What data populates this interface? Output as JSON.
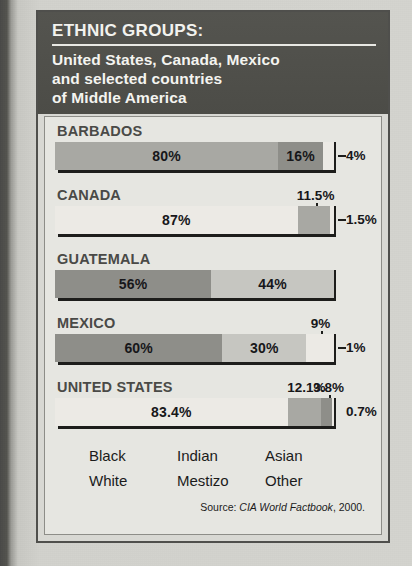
{
  "header": {
    "title": "ETHNIC GROUPS:",
    "subtitle_lines": [
      "United States, Canada, Mexico",
      "and selected countries",
      "of Middle America"
    ]
  },
  "legend": {
    "items": [
      "Black",
      "Indian",
      "Asian",
      "White",
      "Mestizo",
      "Other"
    ]
  },
  "source": {
    "prefix": "Source:",
    "publication": "CIA World Factbook",
    "year": ", 2000."
  },
  "colors": {
    "paper": "#d4d4cf",
    "header_bg": "#4c4c47",
    "panel_bg": "#e6e6e1",
    "frame": "#4f4f4c",
    "seg_dark": "#8e8e89",
    "seg_mid": "#a8a8a3",
    "seg_light": "#c6c6c1",
    "seg_white": "#eceae5",
    "ink": "#1d1d1b"
  },
  "chart_data": {
    "type": "bar",
    "title": "ETHNIC GROUPS: United States, Canada, Mexico and selected countries of Middle America",
    "orientation": "horizontal-stacked",
    "unit": "percent",
    "xlim": [
      0,
      100
    ],
    "grid": false,
    "legend_position": "bottom",
    "legend_entries": [
      "Black",
      "Indian",
      "Asian",
      "White",
      "Mestizo",
      "Other"
    ],
    "categories": [
      "BARBADOS",
      "CANADA",
      "GUATEMALA",
      "MEXICO",
      "UNITED STATES"
    ],
    "rows": [
      {
        "country": "BARBADOS",
        "segments": [
          {
            "label": "80%",
            "value": 80,
            "shade": "seg_mid",
            "placement": "inside"
          },
          {
            "label": "16%",
            "value": 16,
            "shade": "seg_dark",
            "placement": "inside"
          },
          {
            "label": "4%",
            "value": 4,
            "shade": "seg_white",
            "placement": "right-leader"
          }
        ]
      },
      {
        "country": "CANADA",
        "segments": [
          {
            "label": "87%",
            "value": 87,
            "shade": "seg_white",
            "placement": "inside"
          },
          {
            "label": "11.5%",
            "value": 11.5,
            "shade": "seg_mid",
            "placement": "above-tick"
          },
          {
            "label": "1.5%",
            "value": 1.5,
            "shade": "seg_white",
            "placement": "right-leader"
          }
        ]
      },
      {
        "country": "GUATEMALA",
        "segments": [
          {
            "label": "56%",
            "value": 56,
            "shade": "seg_dark",
            "placement": "inside"
          },
          {
            "label": "44%",
            "value": 44,
            "shade": "seg_light",
            "placement": "inside"
          }
        ]
      },
      {
        "country": "MEXICO",
        "segments": [
          {
            "label": "60%",
            "value": 60,
            "shade": "seg_dark",
            "placement": "inside"
          },
          {
            "label": "30%",
            "value": 30,
            "shade": "seg_light",
            "placement": "inside"
          },
          {
            "label": "9%",
            "value": 9,
            "shade": "seg_white",
            "placement": "above-tick"
          },
          {
            "label": "1%",
            "value": 1,
            "shade": "seg_white",
            "placement": "right-leader"
          }
        ]
      },
      {
        "country": "UNITED STATES",
        "segments": [
          {
            "label": "83.4%",
            "value": 83.4,
            "shade": "seg_white",
            "placement": "inside"
          },
          {
            "label": "12.1%",
            "value": 12.1,
            "shade": "seg_mid",
            "placement": "above"
          },
          {
            "label": "3.8%",
            "value": 3.8,
            "shade": "seg_dark",
            "placement": "above-tick"
          },
          {
            "label": "0.7%",
            "value": 0.7,
            "shade": "seg_white",
            "placement": "right"
          }
        ]
      }
    ]
  }
}
